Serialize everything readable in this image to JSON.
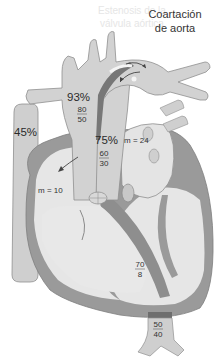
{
  "title": {
    "line1": "Coartación",
    "line2": "de aorta"
  },
  "ghost_text": {
    "line1": "Estenosis de la",
    "line2": "válvula aórtica"
  },
  "labels": {
    "svc_saturation": "45%",
    "aorta_saturation": "93%",
    "aorta_pressure": {
      "systolic": "80",
      "diastolic": "50"
    },
    "pa_saturation": "75%",
    "pa_pressure": {
      "systolic": "60",
      "diastolic": "30"
    },
    "la_mean": "m = 24",
    "ra_mean": "m = 10",
    "lv_pressure": {
      "systolic": "70",
      "diastolic": "8"
    },
    "descending_aorta_pressure": {
      "systolic": "50",
      "diastolic": "40"
    }
  },
  "colors": {
    "chamber_fill": "#e6e6e6",
    "vessel_fill": "#cfcfcf",
    "wall_fill": "#9a9a9a",
    "wall_dark": "#858585",
    "outline": "#8a8a8a",
    "text": "#2a2a2a"
  }
}
